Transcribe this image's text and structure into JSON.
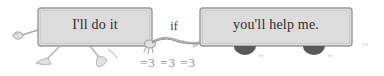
{
  "illustration": {
    "title": "Conditional sentence cartoon: walking box pulling a wheeled cart",
    "background_color": "#ffffff",
    "ink_color": "#8c8c8c",
    "box_fill_color": "#dcdcdc",
    "box_border_color": "#9a9a9a",
    "text_color": "#2c2c2c",
    "wheel_color": "#555555"
  },
  "clause1": {
    "label": "I'll do it",
    "role": "main-clause-box",
    "has_arm": true,
    "has_legs": true
  },
  "connector": {
    "label": "if",
    "role": "subordinating-conjunction"
  },
  "clause2": {
    "label": "you'll help me.",
    "role": "subordinate-clause-cart",
    "wheel_count": 2
  },
  "motion_marks": {
    "label": "=3 =3 =3",
    "role": "motion-scribble"
  }
}
